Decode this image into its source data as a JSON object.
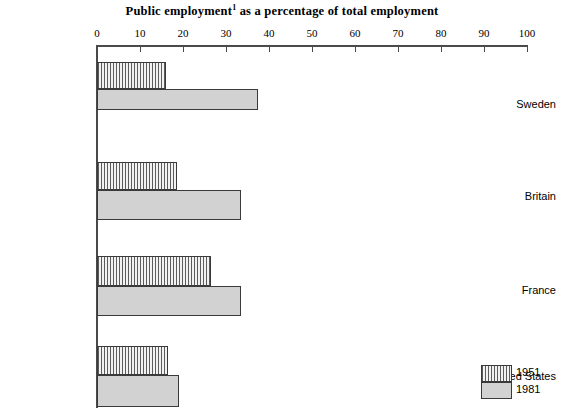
{
  "chart_data": {
    "type": "bar",
    "orientation": "horizontal",
    "title": "Public employment",
    "title_superscript": "1",
    "title_suffix": " as a percentage of total employment",
    "title_full": "Public employment1 as a percentage of total employment",
    "xlabel": "",
    "ylabel": "",
    "xlim": [
      0,
      100
    ],
    "xticks": [
      0,
      10,
      20,
      30,
      40,
      50,
      60,
      70,
      80,
      90,
      100
    ],
    "xtick_labels": [
      "0",
      "10",
      "20",
      "30",
      "40",
      "50",
      "60",
      "70",
      "80",
      "90",
      "100"
    ],
    "grid": false,
    "categories": [
      "Sweden",
      "Britain",
      "France",
      "United States"
    ],
    "series": [
      {
        "name": "1951",
        "pattern": "hatched",
        "values": [
          16,
          18.5,
          26.5,
          16.5
        ]
      },
      {
        "name": "1981",
        "pattern": "solid",
        "values": [
          37.5,
          33.5,
          33.5,
          19
        ]
      }
    ],
    "legend": {
      "position": "bottom-right",
      "entries": [
        {
          "label": "1951",
          "pattern": "hatched"
        },
        {
          "label": "1981",
          "pattern": "solid"
        }
      ]
    },
    "colors": {
      "solid_fill": "#d2d2d2",
      "hatch_line": "#5c5c5c",
      "hatch_background": "#f2f2f2",
      "bar_border": "#3a3a3a",
      "axis": "#4a4a4a",
      "text": "#000000",
      "background": "#ffffff"
    }
  },
  "geometry": {
    "x_origin_px": 97,
    "x_span_px": 430,
    "axis_top_px": 45,
    "axis_bottom_px": 408,
    "groups": [
      {
        "category": "Sweden",
        "bar1_top": 62,
        "bar1_height": 27,
        "bar2_top": 89,
        "bar2_height": 21,
        "label_y": 104
      },
      {
        "category": "Britain",
        "bar1_top": 162,
        "bar1_height": 28,
        "bar2_top": 190,
        "bar2_height": 30,
        "label_y": 196
      },
      {
        "category": "France",
        "bar1_top": 256,
        "bar1_height": 30,
        "bar2_top": 286,
        "bar2_height": 30,
        "label_y": 290
      },
      {
        "category": "United States",
        "bar1_top": 346,
        "bar1_height": 29,
        "bar2_top": 375,
        "bar2_height": 32,
        "label_y": 376
      }
    ]
  }
}
